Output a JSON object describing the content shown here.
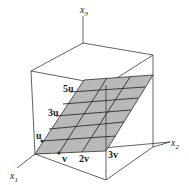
{
  "diagram": {
    "type": "3d-axes-plane-span",
    "axes": {
      "x1": {
        "label": "x",
        "subscript": "1"
      },
      "x2": {
        "label": "x",
        "subscript": "2"
      },
      "x3": {
        "label": "x",
        "subscript": "3"
      }
    },
    "plane_labels": {
      "u": "u",
      "three_u": "3u",
      "five_u": "5u",
      "v": "v",
      "two_v": "2v",
      "three_v": "3v"
    },
    "colors": {
      "plane_fill": "#b9b9b9",
      "lines": "#2e2e2e",
      "background": "#ffffff"
    }
  }
}
